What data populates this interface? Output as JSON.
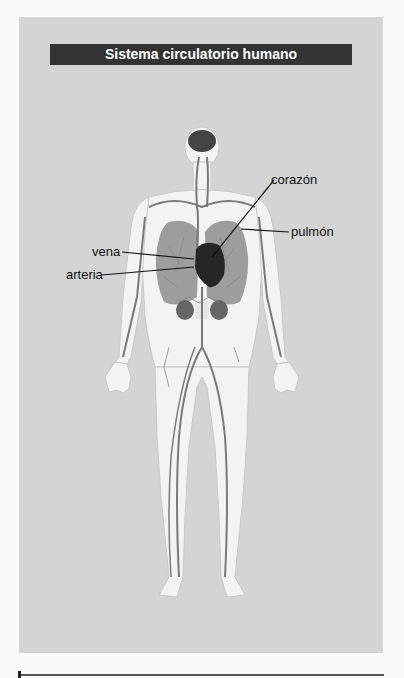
{
  "figure": {
    "title": "Sistema circulatorio humano",
    "labels": {
      "heart": "corazón",
      "lung": "pulmón",
      "vein": "vena",
      "artery": "arteria"
    },
    "colors": {
      "panel": "#d4d4d4",
      "title_bar": "#333333",
      "body": "#f2f2f2",
      "organ_dark": "#2a2a2a",
      "lung": "#9a9a9a",
      "vessel": "#7a7a7a"
    }
  }
}
